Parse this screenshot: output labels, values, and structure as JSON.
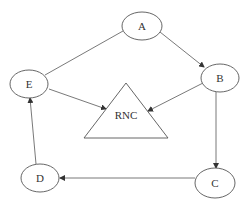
{
  "diagram": {
    "title": "",
    "nodes": [
      {
        "id": "A",
        "label": "A",
        "shape": "ellipse",
        "cx": 142,
        "cy": 26,
        "rx": 20,
        "ry": 14
      },
      {
        "id": "B",
        "label": "B",
        "shape": "ellipse",
        "cx": 220,
        "cy": 78,
        "rx": 19,
        "ry": 14
      },
      {
        "id": "C",
        "label": "C",
        "shape": "ellipse",
        "cx": 215,
        "cy": 183,
        "rx": 20,
        "ry": 15
      },
      {
        "id": "D",
        "label": "D",
        "shape": "ellipse",
        "cx": 40,
        "cy": 178,
        "rx": 19,
        "ry": 14
      },
      {
        "id": "E",
        "label": "E",
        "shape": "ellipse",
        "cx": 29,
        "cy": 84,
        "rx": 19,
        "ry": 14
      },
      {
        "id": "RNC",
        "label": "RNC",
        "shape": "triangle",
        "points": "126,83 84,138 168,138",
        "label_x": 126,
        "label_y": 116
      }
    ],
    "edges": [
      {
        "from": "E",
        "to": "A",
        "directed": false
      },
      {
        "from": "A",
        "to": "B",
        "directed": true
      },
      {
        "from": "B",
        "to": "C",
        "directed": true
      },
      {
        "from": "C",
        "to": "D",
        "directed": true
      },
      {
        "from": "D",
        "to": "E",
        "directed": true
      },
      {
        "from": "E",
        "to": "RNC",
        "directed": true
      },
      {
        "from": "B",
        "to": "RNC",
        "directed": true
      }
    ],
    "colors": {
      "stroke": "#555555",
      "text": "#333333",
      "background": "#ffffff"
    }
  }
}
